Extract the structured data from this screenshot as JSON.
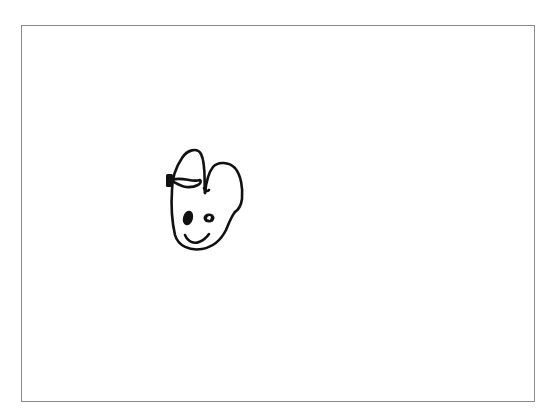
{
  "canvas": {
    "background": "#ffffff",
    "frame_color": "#8a8a8a",
    "ink_color": "#111111"
  },
  "drawing": {
    "subject": "hand-drawn cartoon bunny face with bow",
    "parts": [
      "head-outline",
      "left-ear-loop",
      "right-ear",
      "bow-knot",
      "left-eye",
      "right-eye",
      "smile"
    ]
  }
}
